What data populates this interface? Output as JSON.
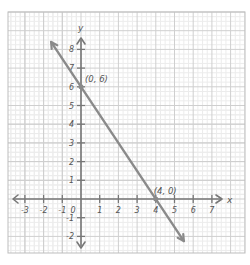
{
  "chart_data": {
    "type": "line",
    "title": "",
    "xlabel": "x",
    "ylabel": "y",
    "xlim": [
      -3,
      7
    ],
    "ylim": [
      -2,
      8
    ],
    "grid": true,
    "grid_minor_subdivisions": 4,
    "x_ticks": [
      -3,
      -2,
      -1,
      0,
      1,
      2,
      3,
      4,
      5,
      6,
      7
    ],
    "y_ticks": [
      -2,
      -1,
      1,
      2,
      3,
      4,
      5,
      6,
      7,
      8
    ],
    "x_tick_labels": [
      "-3",
      "-2",
      "-1",
      "0",
      "1",
      "2",
      "3",
      "4",
      "5",
      "6",
      "7"
    ],
    "y_tick_labels": [
      "-2",
      "-1",
      "1",
      "2",
      "3",
      "4",
      "5",
      "6",
      "7",
      "8"
    ],
    "origin_label": "0",
    "series": [
      {
        "name": "line",
        "equation": "y = -1.5x + 6",
        "x": [
          -1.6,
          5.5
        ],
        "y": [
          8.4,
          -2.25
        ],
        "arrows": "both ends",
        "color": "#888888"
      }
    ],
    "annotations": [
      {
        "text": "(0, 6)",
        "x": 0,
        "y": 6
      },
      {
        "text": "(4, 0)",
        "x": 4,
        "y": 0
      }
    ]
  },
  "colors": {
    "line": "#8a8a8a",
    "axis": "#777777",
    "grid_major": "#cfcfcf",
    "grid_minor": "#ececec",
    "text": "#555555"
  }
}
